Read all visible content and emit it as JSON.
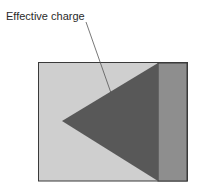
{
  "diagram": {
    "label": "Effective charge",
    "colors": {
      "background_region": "#cfcfcf",
      "triangle": "#585858",
      "right_strip": "#8e8e8e",
      "border": "#3a3a3a",
      "leader_line": "#555555"
    }
  }
}
